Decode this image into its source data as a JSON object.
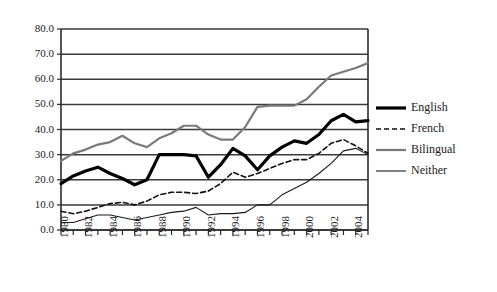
{
  "chart_data": {
    "type": "line",
    "title": "",
    "subtitle": "",
    "xlabel": "",
    "ylabel": "",
    "ylim": [
      0.0,
      80.0
    ],
    "ytick_labels": [
      "0.0",
      "10.0",
      "20.0",
      "30.0",
      "40.0",
      "50.0",
      "60.0",
      "70.0",
      "80.0"
    ],
    "ytick_values": [
      0,
      10,
      20,
      30,
      40,
      50,
      60,
      70,
      80
    ],
    "grid": "horizontal",
    "legend_position": "right",
    "x": [
      1980,
      1981,
      1982,
      1983,
      1984,
      1985,
      1986,
      1987,
      1988,
      1989,
      1990,
      1991,
      1992,
      1993,
      1994,
      1995,
      1996,
      1997,
      1998,
      1999,
      2000,
      2001,
      2002,
      2003,
      2004,
      2005
    ],
    "xtick_labels": [
      "1980",
      "1982",
      "1984",
      "1986",
      "1988",
      "1990",
      "1992",
      "1994",
      "1996",
      "1998",
      "2000",
      "2002",
      "2004"
    ],
    "xtick_values": [
      1980,
      1982,
      1984,
      1986,
      1988,
      1990,
      1992,
      1994,
      1996,
      1998,
      2000,
      2002,
      2004
    ],
    "series": [
      {
        "name": "English",
        "style": "thick-solid",
        "color": "#000000",
        "width": 3.2,
        "dash": "",
        "values": [
          18.5,
          21.5,
          23.5,
          25.0,
          22.5,
          20.5,
          18.0,
          20.0,
          30.0,
          30.0,
          30.0,
          29.5,
          21.0,
          26.0,
          32.5,
          29.5,
          24.0,
          29.5,
          33.0,
          35.5,
          34.5,
          38.0,
          43.5,
          46.0,
          43.0,
          43.5
        ]
      },
      {
        "name": "French",
        "style": "dashed",
        "color": "#111111",
        "width": 1.6,
        "dash": "5,3",
        "values": [
          7.5,
          6.5,
          7.5,
          9.0,
          10.5,
          11.0,
          10.0,
          11.5,
          14.0,
          15.0,
          15.0,
          14.5,
          15.5,
          18.5,
          23.0,
          21.0,
          22.5,
          24.5,
          26.5,
          28.0,
          28.0,
          30.5,
          34.5,
          36.0,
          33.5,
          30.5
        ]
      },
      {
        "name": "Bilingual",
        "style": "gray-solid",
        "color": "#7a7a7a",
        "width": 2.2,
        "dash": "",
        "values": [
          27.5,
          30.5,
          32.0,
          34.0,
          35.0,
          37.5,
          34.5,
          33.0,
          36.5,
          38.5,
          41.5,
          41.5,
          38.0,
          36.0,
          36.0,
          41.0,
          49.0,
          49.5,
          49.5,
          49.5,
          52.0,
          57.0,
          61.5,
          63.0,
          64.5,
          66.5
        ]
      },
      {
        "name": "Neither",
        "style": "thin-solid",
        "color": "#1a1a1a",
        "width": 1.1,
        "dash": "",
        "values": [
          3.0,
          3.0,
          4.5,
          6.0,
          6.0,
          5.0,
          4.0,
          5.0,
          6.0,
          7.0,
          7.5,
          9.0,
          6.0,
          6.5,
          6.5,
          7.0,
          10.0,
          10.0,
          14.0,
          16.5,
          19.0,
          22.5,
          26.5,
          31.5,
          32.5,
          30.0
        ]
      }
    ]
  },
  "legend": {
    "entries": [
      {
        "label": "English"
      },
      {
        "label": "French"
      },
      {
        "label": "Bilingual"
      },
      {
        "label": "Neither"
      }
    ]
  }
}
